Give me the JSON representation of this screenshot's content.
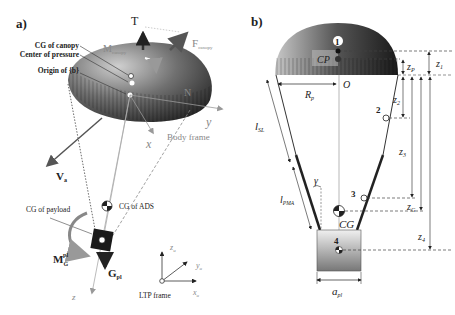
{
  "panel_a": {
    "tag": "a)",
    "labels": {
      "T": "T",
      "F": "F",
      "F_sub": "canopy",
      "M": "M",
      "M_sub": "canopy",
      "N": "N",
      "cg_canopy": "CG of canopy",
      "center_pressure": "Center of pressure",
      "origin_b": "Origin of {b}",
      "y": "y",
      "x": "x",
      "z": "z",
      "body_frame": "Body frame",
      "Va": "V",
      "Va_sub": "a",
      "cg_payload": "CG of payload",
      "cg_ads": "CG of ADS",
      "MG": "M",
      "MG_sub": "G",
      "MG_sup": "pl",
      "Gpl": "G",
      "Gpl_sub": "pl",
      "zu": "z",
      "zu_sub": "u",
      "yu": "y",
      "yu_sub": "u",
      "xu": "x",
      "xu_sub": "u",
      "ltp_frame": "LTP frame"
    }
  },
  "panel_b": {
    "tag": "b)",
    "labels": {
      "p1": "1",
      "p2": "2",
      "p3": "3",
      "p4": "4",
      "CP": "CP",
      "O": "O",
      "CG": "CG",
      "Rp": "R",
      "Rp_sub": "p",
      "lSL": "l",
      "lSL_sub": "SL",
      "lPMA": "l",
      "lPMA_sub": "PMA",
      "gamma": "γ",
      "apl": "a",
      "apl_sub": "pl",
      "z1": "z",
      "z1_sub": "1",
      "zP": "z",
      "zP_sub": "P",
      "z2": "z",
      "z2_sub": "2",
      "z3": "z",
      "z3_sub": "3",
      "zG": "z",
      "zG_sub": "G",
      "z4": "z",
      "z4_sub": "4"
    }
  }
}
